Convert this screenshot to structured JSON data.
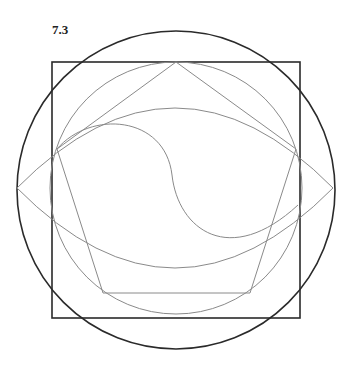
{
  "figure": {
    "label": "7.3",
    "colors": {
      "dark": "#2a2a2a",
      "light": "#8a8a8a"
    },
    "shapes": {
      "outer_circle": {
        "cx": 176,
        "cy": 190,
        "r": 159
      },
      "square": {
        "x": 52,
        "y": 62,
        "width": 248,
        "height": 256
      },
      "inner_circle": {
        "cx": 176,
        "cy": 188,
        "r": 126
      },
      "pentagon": [
        [
          176,
          62
        ],
        [
          296,
          149
        ],
        [
          250,
          293
        ],
        [
          103,
          293
        ],
        [
          57,
          149
        ]
      ],
      "lens": {
        "left": [
          17,
          188
        ],
        "right": [
          333,
          188
        ],
        "top_y": 108,
        "bottom_y": 268
      },
      "s_curve": {
        "start": [
          57,
          149
        ],
        "mid": [
          176,
          190
        ],
        "end": [
          298,
          205
        ]
      }
    }
  }
}
